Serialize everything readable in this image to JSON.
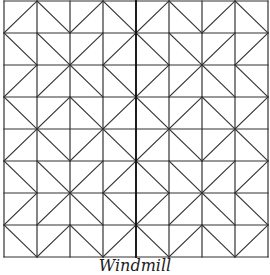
{
  "figure": {
    "title": "Windmill",
    "grid": {
      "cols": 8,
      "rows": 8,
      "x0": 4,
      "y0": 1,
      "cell_w": 33,
      "cell_h": 32
    },
    "block_pattern": [
      [
        "/",
        "\\",
        "/",
        "\\"
      ],
      [
        "\\",
        "\\",
        "/",
        "/"
      ],
      [
        "/",
        "/",
        "\\",
        "\\"
      ],
      [
        "\\",
        "/",
        "\\",
        "/"
      ]
    ],
    "line_color": "#333333",
    "center_line_color": "#111111"
  },
  "caption": "Windmill"
}
